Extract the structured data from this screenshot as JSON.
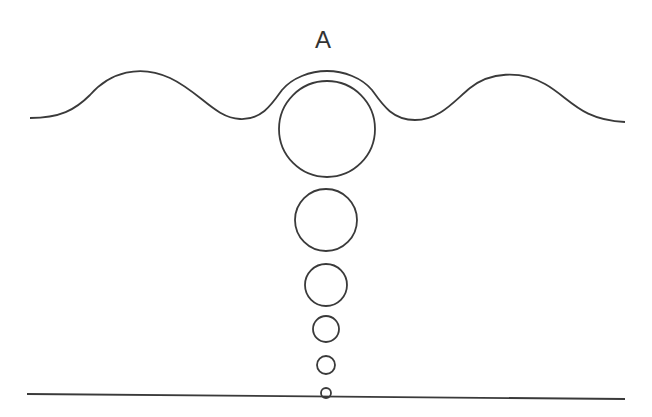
{
  "diagram": {
    "label": "A",
    "stroke_color": "#3a3a3a",
    "background": "#ffffff",
    "wave": {
      "description": "wavy water surface with crest over large bubble"
    },
    "bubbles": [
      {
        "cx": 327,
        "cy": 129,
        "r": 48
      },
      {
        "cx": 326,
        "cy": 220,
        "r": 31
      },
      {
        "cx": 326,
        "cy": 285,
        "r": 21
      },
      {
        "cx": 326,
        "cy": 329,
        "r": 13
      },
      {
        "cx": 326,
        "cy": 365,
        "r": 9
      },
      {
        "cx": 326,
        "cy": 393,
        "r": 5
      }
    ],
    "ground_line": {
      "x1": 27,
      "y1": 394,
      "x2": 625,
      "y2": 399
    }
  }
}
